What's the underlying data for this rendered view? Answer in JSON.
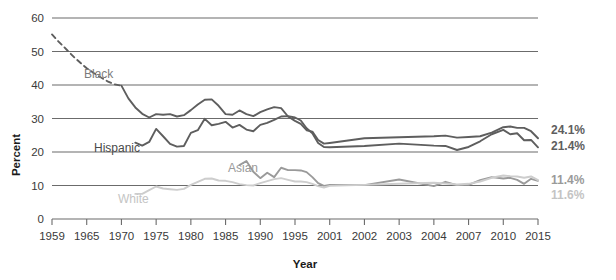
{
  "chart_data": {
    "type": "line",
    "title": "",
    "xlabel": "Year",
    "ylabel": "Percent",
    "ylim": [
      0,
      60
    ],
    "yticks": [
      0,
      10,
      20,
      30,
      40,
      50,
      60
    ],
    "grid": "horizontal",
    "legend": "inline-labels",
    "x": [
      1959,
      1965,
      1970,
      1975,
      1980,
      1985,
      1990,
      1995,
      2001,
      2002,
      2003,
      2004,
      2007,
      2010,
      2015
    ],
    "categories": [
      "1959",
      "1965",
      "1970",
      "1975",
      "1980",
      "1985",
      "1990",
      "1995",
      "2001",
      "2002",
      "2003",
      "2004",
      "2007",
      "2010",
      "2015"
    ],
    "series": [
      {
        "name": "Black",
        "color": "#5e5e5e",
        "label_color": "#7b7b7b",
        "end_label": "24.1%",
        "dashed_until": 1970,
        "points": [
          {
            "year": 1959,
            "value": 55.1
          },
          {
            "year": 1960,
            "value": 53.2
          },
          {
            "year": 1961,
            "value": 51.5
          },
          {
            "year": 1962,
            "value": 49.7
          },
          {
            "year": 1963,
            "value": 48.0
          },
          {
            "year": 1964,
            "value": 46.5
          },
          {
            "year": 1965,
            "value": 45.0
          },
          {
            "year": 1966,
            "value": 43.6
          },
          {
            "year": 1967,
            "value": 42.3
          },
          {
            "year": 1968,
            "value": 41.1
          },
          {
            "year": 1969,
            "value": 40.2
          },
          {
            "year": 1970,
            "value": 39.8
          },
          {
            "year": 1971,
            "value": 36.0
          },
          {
            "year": 1972,
            "value": 33.3
          },
          {
            "year": 1973,
            "value": 31.4
          },
          {
            "year": 1974,
            "value": 30.3
          },
          {
            "year": 1975,
            "value": 31.3
          },
          {
            "year": 1976,
            "value": 31.1
          },
          {
            "year": 1977,
            "value": 31.3
          },
          {
            "year": 1978,
            "value": 30.6
          },
          {
            "year": 1979,
            "value": 31.0
          },
          {
            "year": 1980,
            "value": 32.5
          },
          {
            "year": 1981,
            "value": 34.2
          },
          {
            "year": 1982,
            "value": 35.6
          },
          {
            "year": 1983,
            "value": 35.7
          },
          {
            "year": 1984,
            "value": 33.8
          },
          {
            "year": 1985,
            "value": 31.3
          },
          {
            "year": 1986,
            "value": 31.1
          },
          {
            "year": 1987,
            "value": 32.4
          },
          {
            "year": 1988,
            "value": 31.3
          },
          {
            "year": 1989,
            "value": 30.7
          },
          {
            "year": 1990,
            "value": 31.9
          },
          {
            "year": 1991,
            "value": 32.7
          },
          {
            "year": 1992,
            "value": 33.4
          },
          {
            "year": 1993,
            "value": 33.1
          },
          {
            "year": 1994,
            "value": 30.6
          },
          {
            "year": 1995,
            "value": 29.3
          },
          {
            "year": 1996,
            "value": 28.4
          },
          {
            "year": 1997,
            "value": 26.5
          },
          {
            "year": 1998,
            "value": 26.1
          },
          {
            "year": 1999,
            "value": 23.6
          },
          {
            "year": 2000,
            "value": 22.5
          },
          {
            "year": 2001,
            "value": 22.7
          },
          {
            "year": 2002,
            "value": 24.1
          },
          {
            "year": 2003,
            "value": 24.4
          },
          {
            "year": 2004,
            "value": 24.7
          },
          {
            "year": 2005,
            "value": 24.9
          },
          {
            "year": 2006,
            "value": 24.3
          },
          {
            "year": 2007,
            "value": 24.5
          },
          {
            "year": 2008,
            "value": 24.7
          },
          {
            "year": 2009,
            "value": 25.8
          },
          {
            "year": 2010,
            "value": 27.4
          },
          {
            "year": 2011,
            "value": 27.6
          },
          {
            "year": 2012,
            "value": 27.2
          },
          {
            "year": 2013,
            "value": 27.2
          },
          {
            "year": 2014,
            "value": 26.2
          },
          {
            "year": 2015,
            "value": 24.1
          }
        ]
      },
      {
        "name": "Hispanic",
        "color": "#5e5e5e",
        "label_color": "#4a4a4a",
        "end_label": "21.4%",
        "dashed_until": null,
        "points": [
          {
            "year": 1972,
            "value": 22.8
          },
          {
            "year": 1973,
            "value": 21.9
          },
          {
            "year": 1974,
            "value": 23.0
          },
          {
            "year": 1975,
            "value": 26.9
          },
          {
            "year": 1976,
            "value": 24.7
          },
          {
            "year": 1977,
            "value": 22.4
          },
          {
            "year": 1978,
            "value": 21.6
          },
          {
            "year": 1979,
            "value": 21.8
          },
          {
            "year": 1980,
            "value": 25.7
          },
          {
            "year": 1981,
            "value": 26.5
          },
          {
            "year": 1982,
            "value": 29.9
          },
          {
            "year": 1983,
            "value": 28.0
          },
          {
            "year": 1984,
            "value": 28.4
          },
          {
            "year": 1985,
            "value": 29.0
          },
          {
            "year": 1986,
            "value": 27.3
          },
          {
            "year": 1987,
            "value": 28.1
          },
          {
            "year": 1988,
            "value": 26.7
          },
          {
            "year": 1989,
            "value": 26.2
          },
          {
            "year": 1990,
            "value": 28.1
          },
          {
            "year": 1991,
            "value": 28.7
          },
          {
            "year": 1992,
            "value": 29.6
          },
          {
            "year": 1993,
            "value": 30.6
          },
          {
            "year": 1994,
            "value": 30.7
          },
          {
            "year": 1995,
            "value": 30.3
          },
          {
            "year": 1996,
            "value": 29.4
          },
          {
            "year": 1997,
            "value": 27.1
          },
          {
            "year": 1998,
            "value": 25.6
          },
          {
            "year": 1999,
            "value": 22.7
          },
          {
            "year": 2000,
            "value": 21.5
          },
          {
            "year": 2001,
            "value": 21.4
          },
          {
            "year": 2002,
            "value": 21.8
          },
          {
            "year": 2003,
            "value": 22.5
          },
          {
            "year": 2004,
            "value": 21.9
          },
          {
            "year": 2005,
            "value": 21.8
          },
          {
            "year": 2006,
            "value": 20.6
          },
          {
            "year": 2007,
            "value": 21.5
          },
          {
            "year": 2008,
            "value": 23.2
          },
          {
            "year": 2009,
            "value": 25.3
          },
          {
            "year": 2010,
            "value": 26.6
          },
          {
            "year": 2011,
            "value": 25.3
          },
          {
            "year": 2012,
            "value": 25.6
          },
          {
            "year": 2013,
            "value": 23.5
          },
          {
            "year": 2014,
            "value": 23.6
          },
          {
            "year": 2015,
            "value": 21.4
          }
        ]
      },
      {
        "name": "Asian",
        "color": "#9a9a9a",
        "label_color": "#9a9a9a",
        "end_label": "11.4%",
        "dashed_until": null,
        "points": [
          {
            "year": 1987,
            "value": 16.1
          },
          {
            "year": 1988,
            "value": 17.3
          },
          {
            "year": 1989,
            "value": 14.1
          },
          {
            "year": 1990,
            "value": 12.2
          },
          {
            "year": 1991,
            "value": 13.8
          },
          {
            "year": 1992,
            "value": 12.5
          },
          {
            "year": 1993,
            "value": 15.3
          },
          {
            "year": 1994,
            "value": 14.6
          },
          {
            "year": 1995,
            "value": 14.6
          },
          {
            "year": 1996,
            "value": 14.5
          },
          {
            "year": 1997,
            "value": 14.0
          },
          {
            "year": 1998,
            "value": 12.5
          },
          {
            "year": 1999,
            "value": 10.7
          },
          {
            "year": 2000,
            "value": 9.9
          },
          {
            "year": 2001,
            "value": 10.2
          },
          {
            "year": 2002,
            "value": 10.1
          },
          {
            "year": 2003,
            "value": 11.8
          },
          {
            "year": 2004,
            "value": 9.8
          },
          {
            "year": 2005,
            "value": 11.1
          },
          {
            "year": 2006,
            "value": 10.1
          },
          {
            "year": 2007,
            "value": 10.2
          },
          {
            "year": 2008,
            "value": 11.6
          },
          {
            "year": 2009,
            "value": 12.5
          },
          {
            "year": 2010,
            "value": 12.1
          },
          {
            "year": 2011,
            "value": 12.3
          },
          {
            "year": 2012,
            "value": 11.7
          },
          {
            "year": 2013,
            "value": 10.5
          },
          {
            "year": 2014,
            "value": 12.0
          },
          {
            "year": 2015,
            "value": 11.4
          }
        ]
      },
      {
        "name": "White",
        "color": "#cdcdcd",
        "label_color": "#c4c4c4",
        "end_label": "11.6%",
        "dashed_until": null,
        "points": [
          {
            "year": 1972,
            "value": 7.5
          },
          {
            "year": 1973,
            "value": 7.5
          },
          {
            "year": 1974,
            "value": 8.6
          },
          {
            "year": 1975,
            "value": 9.7
          },
          {
            "year": 1976,
            "value": 9.1
          },
          {
            "year": 1977,
            "value": 8.9
          },
          {
            "year": 1978,
            "value": 8.7
          },
          {
            "year": 1979,
            "value": 9.0
          },
          {
            "year": 1980,
            "value": 10.2
          },
          {
            "year": 1981,
            "value": 11.1
          },
          {
            "year": 1982,
            "value": 12.0
          },
          {
            "year": 1983,
            "value": 12.1
          },
          {
            "year": 1984,
            "value": 11.5
          },
          {
            "year": 1985,
            "value": 11.4
          },
          {
            "year": 1986,
            "value": 11.0
          },
          {
            "year": 1987,
            "value": 10.4
          },
          {
            "year": 1988,
            "value": 10.1
          },
          {
            "year": 1989,
            "value": 10.0
          },
          {
            "year": 1990,
            "value": 10.7
          },
          {
            "year": 1991,
            "value": 11.3
          },
          {
            "year": 1992,
            "value": 11.9
          },
          {
            "year": 1993,
            "value": 12.2
          },
          {
            "year": 1994,
            "value": 11.7
          },
          {
            "year": 1995,
            "value": 11.2
          },
          {
            "year": 1996,
            "value": 11.2
          },
          {
            "year": 1997,
            "value": 11.0
          },
          {
            "year": 1998,
            "value": 10.5
          },
          {
            "year": 1999,
            "value": 9.8
          },
          {
            "year": 2000,
            "value": 9.4
          },
          {
            "year": 2001,
            "value": 9.9
          },
          {
            "year": 2002,
            "value": 10.2
          },
          {
            "year": 2003,
            "value": 10.5
          },
          {
            "year": 2004,
            "value": 10.8
          },
          {
            "year": 2005,
            "value": 10.6
          },
          {
            "year": 2006,
            "value": 10.3
          },
          {
            "year": 2007,
            "value": 10.5
          },
          {
            "year": 2008,
            "value": 11.2
          },
          {
            "year": 2009,
            "value": 12.3
          },
          {
            "year": 2010,
            "value": 13.0
          },
          {
            "year": 2011,
            "value": 12.8
          },
          {
            "year": 2012,
            "value": 12.7
          },
          {
            "year": 2013,
            "value": 12.3
          },
          {
            "year": 2014,
            "value": 12.7
          },
          {
            "year": 2015,
            "value": 11.6
          }
        ]
      }
    ],
    "inline_labels": [
      {
        "text": "Black",
        "x": 84,
        "y": 78,
        "color": "#7b7b7b"
      },
      {
        "text": "Hispanic",
        "x": 94,
        "y": 152,
        "color": "#4a4a4a"
      },
      {
        "text": "Asian",
        "x": 228,
        "y": 172,
        "color": "#9a9a9a"
      },
      {
        "text": "White",
        "x": 118,
        "y": 203,
        "color": "#c4c4c4"
      }
    ],
    "end_labels": [
      {
        "text": "24.1%",
        "color": "#5e5e5e",
        "y": 134
      },
      {
        "text": "21.4%",
        "color": "#5e5e5e",
        "y": 150
      },
      {
        "text": "11.4%",
        "color": "#9a9a9a",
        "y": 184
      },
      {
        "text": "11.6%",
        "color": "#c4c4c4",
        "y": 199
      }
    ]
  }
}
